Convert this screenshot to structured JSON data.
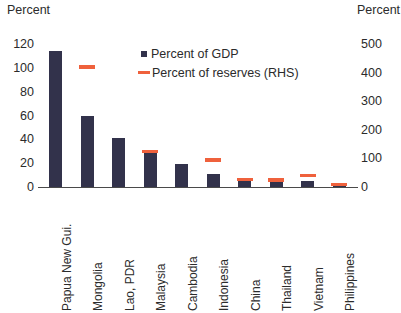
{
  "chart_data": {
    "type": "bar",
    "title": "",
    "subtitle": "",
    "left_axis_title": "Percent",
    "right_axis_title": "Percent",
    "xlabel": "",
    "categories": [
      "Papua New Gui.",
      "Mongolia",
      "Lao, PDR",
      "Malaysia",
      "Cambodia",
      "Indonesia",
      "China",
      "Thailand",
      "Vietnam",
      "Philippines"
    ],
    "series": [
      {
        "name": "Percent of GDP",
        "axis": "left",
        "type": "bar",
        "color": "#32324b",
        "values": [
          114,
          60,
          41,
          30,
          19,
          11,
          6,
          5,
          5,
          1
        ]
      },
      {
        "name": "Percent of reserves (RHS)",
        "axis": "right",
        "type": "marker",
        "color": "#ef613c",
        "values": [
          null,
          420,
          null,
          125,
          null,
          95,
          27,
          24,
          40,
          8
        ]
      }
    ],
    "ylim": [
      0,
      120
    ],
    "yticks": [
      0,
      20,
      40,
      60,
      80,
      100,
      120
    ],
    "ylim_right": [
      0,
      500
    ],
    "yticks_right": [
      0,
      100,
      200,
      300,
      400,
      500
    ],
    "grid": false,
    "legend_position": "top-center",
    "legend": [
      {
        "label": "Percent of GDP",
        "marker": "square",
        "color": "#32324b"
      },
      {
        "label": "Percent of reserves (RHS)",
        "marker": "dash",
        "color": "#ef613c"
      }
    ]
  }
}
